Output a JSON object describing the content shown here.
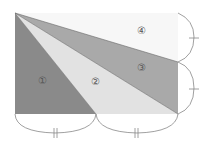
{
  "diagram": {
    "type": "geometry-rectangle-partition",
    "regions": [
      {
        "id": "1",
        "label": "①",
        "color": "#8a8a8a"
      },
      {
        "id": "2",
        "label": "②",
        "color": "#e2e2e2"
      },
      {
        "id": "3",
        "label": "③",
        "color": "#a9a9a9"
      },
      {
        "id": "4",
        "label": "④",
        "color": "#f7f7f7"
      }
    ],
    "marks": {
      "bottom_equal": "||",
      "right_equal": "|"
    },
    "colors": {
      "stroke": "#555555",
      "bracket": "#777777"
    }
  }
}
